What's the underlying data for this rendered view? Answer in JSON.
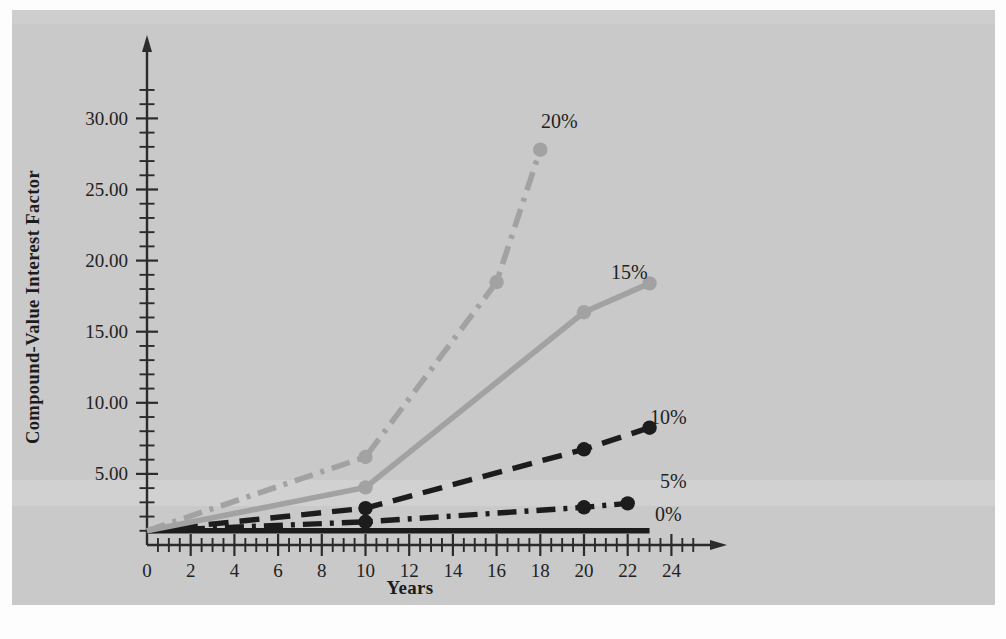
{
  "figure": {
    "background_color": "#c9c9c9",
    "page_color": "#fdfdfd"
  },
  "chart_data": {
    "type": "line",
    "title": "",
    "xlabel": "Years",
    "ylabel": "Compound-Value Interest Factor",
    "xlim": [
      0,
      25.5
    ],
    "ylim": [
      0,
      32
    ],
    "xticks": [
      0,
      2,
      4,
      6,
      8,
      10,
      12,
      14,
      16,
      18,
      20,
      22,
      24
    ],
    "xtick_labels": [
      "0",
      "2",
      "4",
      "6",
      "8",
      "10",
      "12",
      "14",
      "16",
      "18",
      "20",
      "22",
      "24"
    ],
    "x_minor_tick_step": 0.5,
    "yticks": [
      5,
      10,
      15,
      20,
      25,
      30
    ],
    "ytick_labels": [
      "5.00",
      "10.00",
      "15.00",
      "20.00",
      "25.00",
      "30.00"
    ],
    "y_minor_tick_step": 1,
    "grid": false,
    "legend_position": "inline-right-of-line-ends",
    "axis_arrows": true,
    "series": [
      {
        "name": "0%",
        "label": "0%",
        "color": "#1c1c1c",
        "linestyle": "solid",
        "markers": false,
        "x": [
          0,
          23
        ],
        "values": [
          1.0,
          1.0
        ]
      },
      {
        "name": "5%",
        "label": "5%",
        "color": "#1c1c1c",
        "linestyle": "dashdot",
        "markers": true,
        "x": [
          0,
          10,
          20,
          22
        ],
        "values": [
          1.0,
          1.63,
          2.65,
          2.93
        ]
      },
      {
        "name": "10%",
        "label": "10%",
        "color": "#1c1c1c",
        "linestyle": "dashed",
        "markers": true,
        "x": [
          0,
          10,
          20,
          23
        ],
        "values": [
          1.0,
          2.59,
          6.73,
          8.25
        ]
      },
      {
        "name": "15%",
        "label": "15%",
        "color": "#a2a2a2",
        "linestyle": "solid",
        "markers": true,
        "x": [
          0,
          10,
          20,
          23
        ],
        "values": [
          1.0,
          4.05,
          16.37,
          18.4
        ]
      },
      {
        "name": "20%",
        "label": "20%",
        "color": "#a2a2a2",
        "linestyle": "dashdot",
        "markers": true,
        "x": [
          0,
          10,
          16,
          18
        ],
        "values": [
          1.0,
          6.19,
          18.49,
          27.8
        ]
      }
    ],
    "series_end_labels": [
      {
        "text": "20%",
        "x_px": 541,
        "y_px": 128
      },
      {
        "text": "15%",
        "x_px": 611,
        "y_px": 279
      },
      {
        "text": "10%",
        "x_px": 650,
        "y_px": 424
      },
      {
        "text": "5%",
        "x_px": 660,
        "y_px": 488
      },
      {
        "text": "0%",
        "x_px": 655,
        "y_px": 521
      }
    ]
  }
}
